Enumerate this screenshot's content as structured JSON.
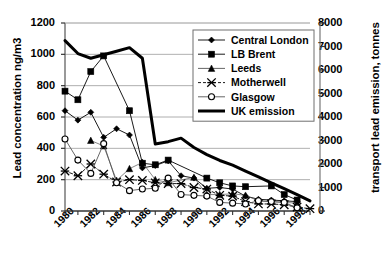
{
  "chart_data": {
    "type": "line",
    "title": "",
    "xlabel": "",
    "ylabel": "Lead concentration ng/m3",
    "ylabel_right": "transport lead emission, tonnes",
    "x": [
      1980,
      1981,
      1982,
      1983,
      1984,
      1985,
      1986,
      1987,
      1988,
      1989,
      1990,
      1991,
      1992,
      1993,
      1994,
      1995,
      1996,
      1997,
      1998,
      1999
    ],
    "xlim": [
      1980,
      1999
    ],
    "xticks": [
      1980,
      1982,
      1984,
      1986,
      1988,
      1990,
      1992,
      1994,
      1996,
      1998
    ],
    "xticklabels": [
      "1980",
      "1982",
      "1984",
      "1986",
      "1988",
      "1990",
      "1992",
      "1994",
      "1996",
      "1998"
    ],
    "ylim": [
      0,
      1200
    ],
    "yticks": [
      0,
      200,
      400,
      600,
      800,
      1000,
      1200
    ],
    "yticklabels": [
      "0",
      "200",
      "400",
      "600",
      "800",
      "1000",
      "1200"
    ],
    "ylim_right": [
      0,
      8000
    ],
    "yticks_right": [
      0,
      1000,
      2000,
      3000,
      4000,
      5000,
      6000,
      7000,
      8000
    ],
    "yticklabels_right": [
      "0",
      "1000",
      "2000",
      "3000",
      "4000",
      "5000",
      "6000",
      "7000",
      "8000"
    ],
    "grid": true,
    "legend_position": "upper right",
    "series": [
      {
        "name": "Central London",
        "marker": "filled-diamond",
        "axis": "left",
        "x": [
          1980,
          1981,
          1982,
          1983,
          1984,
          1985,
          1986,
          1987,
          1988,
          1989,
          1990,
          1991,
          1992,
          1993,
          1994,
          1995,
          1996,
          1997,
          1998
        ],
        "values": [
          640,
          580,
          630,
          470,
          525,
          485,
          275,
          290,
          320,
          225,
          210,
          145,
          150,
          140,
          95,
          75,
          70,
          65,
          60
        ]
      },
      {
        "name": "LB Brent",
        "marker": "filled-square",
        "axis": "left",
        "x": [
          1980,
          1981,
          1982,
          1983,
          1984,
          1985,
          1986,
          1987,
          1988,
          1989,
          1990,
          1991,
          1992,
          1993,
          1994,
          1995,
          1996,
          1997,
          1998
        ],
        "values": [
          765,
          710,
          890,
          990,
          null,
          640,
          305,
          295,
          325,
          null,
          null,
          210,
          180,
          160,
          155,
          null,
          160,
          105,
          70
        ]
      },
      {
        "name": "Leeds",
        "marker": "filled-triangle",
        "axis": "left",
        "x": [
          1982,
          1983,
          1984,
          1985,
          1986,
          1987,
          1988,
          1989,
          1990,
          1991,
          1992,
          1993,
          1994,
          1995,
          1996,
          1997,
          1998
        ],
        "values": [
          450,
          415,
          195,
          270,
          310,
          200,
          180,
          null,
          215,
          105,
          105,
          110,
          100,
          65,
          60,
          55,
          50
        ]
      },
      {
        "name": "Motherwell",
        "marker": "cross-x",
        "axis": "left",
        "x": [
          1980,
          1981,
          1982,
          1983,
          1984,
          1985,
          1986,
          1987,
          1988,
          1989,
          1990,
          1991,
          1992,
          1993,
          1994,
          1995,
          1996,
          1997,
          1998,
          1999
        ],
        "values": [
          255,
          225,
          300,
          235,
          185,
          200,
          195,
          180,
          175,
          175,
          150,
          140,
          100,
          95,
          60,
          45,
          45,
          40,
          25,
          15
        ]
      },
      {
        "name": "Glasgow",
        "marker": "open-circle",
        "axis": "left",
        "x": [
          1980,
          1981,
          1982,
          1983,
          1984,
          1985,
          1986,
          1987,
          1988,
          1989,
          1990,
          1991,
          1992,
          1993,
          1994,
          1995,
          1996,
          1997,
          1998
        ],
        "values": [
          460,
          325,
          240,
          430,
          180,
          130,
          140,
          145,
          210,
          105,
          100,
          95,
          55,
          50,
          45,
          65,
          60,
          55,
          20
        ]
      },
      {
        "name": "UK emission",
        "marker": "none",
        "axis": "right",
        "x": [
          1980,
          1981,
          1982,
          1983,
          1984,
          1985,
          1986,
          1987,
          1988,
          1989,
          1990,
          1991,
          1992,
          1993,
          1994,
          1995,
          1996,
          1997,
          1998,
          1999
        ],
        "values": [
          7250,
          6700,
          6500,
          6650,
          6800,
          6950,
          6500,
          2850,
          2950,
          3100,
          2700,
          2400,
          2150,
          1950,
          1700,
          1450,
          1200,
          950,
          700,
          430
        ]
      }
    ],
    "legend_entries": [
      {
        "label": "Central London",
        "marker": "filled-diamond"
      },
      {
        "label": "LB Brent",
        "marker": "filled-square"
      },
      {
        "label": "Leeds",
        "marker": "filled-triangle"
      },
      {
        "label": "Motherwell",
        "marker": "cross-x"
      },
      {
        "label": "Glasgow",
        "marker": "open-circle"
      },
      {
        "label": "UK emission",
        "marker": "thick-line"
      }
    ]
  }
}
